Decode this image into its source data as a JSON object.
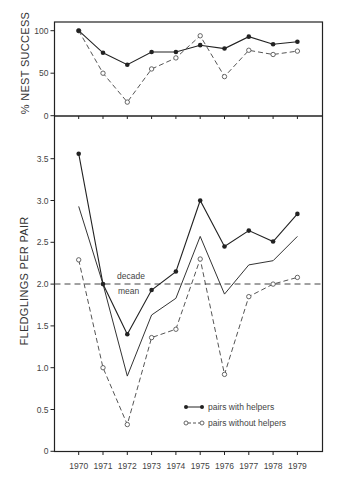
{
  "chart_data": [
    {
      "type": "line",
      "title": "",
      "xlabel": "",
      "ylabel": "% NEST SUCCESS",
      "ylim": [
        0,
        100
      ],
      "yticks": [
        "0",
        "50",
        "100"
      ],
      "x": [
        1970,
        1971,
        1972,
        1973,
        1974,
        1975,
        1976,
        1977,
        1978,
        1979
      ],
      "series": [
        {
          "name": "pairs with helpers",
          "style": "solid-filled",
          "values": [
            100,
            74,
            60,
            75,
            75,
            83,
            79,
            93,
            84,
            87
          ]
        },
        {
          "name": "pairs without helpers",
          "style": "dashed-open",
          "values": [
            100,
            50,
            16,
            55,
            68,
            94,
            46,
            77,
            72,
            76
          ]
        }
      ],
      "grid": false
    },
    {
      "type": "line",
      "title": "",
      "xlabel": "",
      "ylabel": "FLEDGLINGS PER PAIR",
      "ylim": [
        0,
        3.7
      ],
      "yticks": [
        "0",
        "0.5",
        "1.0",
        "1.5",
        "2.0",
        "2.5",
        "3.0",
        "3.5"
      ],
      "x": [
        1970,
        1971,
        1972,
        1973,
        1974,
        1975,
        1976,
        1977,
        1978,
        1979
      ],
      "xticks": [
        "1970",
        "1971",
        "1972",
        "1973",
        "1974",
        "1975",
        "1976",
        "1977",
        "1978",
        "1979"
      ],
      "series": [
        {
          "name": "pairs with helpers",
          "style": "solid-filled",
          "values": [
            3.56,
            2.0,
            1.4,
            1.93,
            2.15,
            3.0,
            2.45,
            2.64,
            2.51,
            2.84
          ]
        },
        {
          "name": "overall mean",
          "style": "solid-no-markers",
          "values": [
            2.93,
            2.0,
            0.9,
            1.63,
            1.83,
            2.57,
            1.88,
            2.23,
            2.28,
            2.57
          ]
        },
        {
          "name": "pairs without helpers",
          "style": "dashed-open",
          "values": [
            2.29,
            1.0,
            0.32,
            1.36,
            1.46,
            2.3,
            0.92,
            1.85,
            2.0,
            2.08
          ]
        }
      ],
      "reference_line": {
        "label": "decade mean",
        "value": 2.0,
        "style": "dashed"
      },
      "legend": {
        "position": "lower right",
        "entries": [
          "pairs with helpers",
          "pairs without helpers"
        ]
      },
      "grid": false
    }
  ],
  "top_panel": {
    "ylabel": "% NEST SUCCESS",
    "yticks": [
      {
        "v": 0,
        "label": "0"
      },
      {
        "v": 50,
        "label": "50"
      },
      {
        "v": 100,
        "label": "100"
      }
    ]
  },
  "bottom_panel": {
    "ylabel": "FLEDGLINGS PER PAIR",
    "yticks": [
      {
        "v": 0,
        "label": "0"
      },
      {
        "v": 0.5,
        "label": "0.5"
      },
      {
        "v": 1.0,
        "label": "1.0"
      },
      {
        "v": 1.5,
        "label": "1.5"
      },
      {
        "v": 2.0,
        "label": "2.0"
      },
      {
        "v": 2.5,
        "label": "2.5"
      },
      {
        "v": 3.0,
        "label": "3.0"
      },
      {
        "v": 3.5,
        "label": "3.5"
      }
    ],
    "annotation": {
      "line1": "decade",
      "line2": "mean"
    }
  },
  "legend": {
    "with_helpers": "pairs with helpers",
    "without_helpers": "pairs without helpers"
  },
  "colors": {
    "ink": "#222222",
    "dashed": "#555555",
    "background": "#ffffff"
  }
}
